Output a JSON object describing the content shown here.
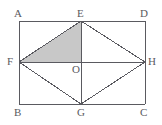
{
  "figure": {
    "kind": "geometry-diagram",
    "background_color": "#ffffff",
    "stroke_color": "#5a5a60",
    "shaded_fill_color": "#c8c8c8",
    "shaded_region_vertices": "E, F, O",
    "rectangle": {
      "name": "ABCD",
      "left": 19,
      "top": 21,
      "right": 145,
      "bottom": 104
    },
    "points": [
      {
        "label": "A",
        "x": 19,
        "y": 21,
        "label_x": 14,
        "label_y": 8,
        "role": "rectangle-corner-top-left"
      },
      {
        "label": "D",
        "x": 145,
        "y": 21,
        "label_x": 140,
        "label_y": 8,
        "role": "rectangle-corner-top-right"
      },
      {
        "label": "B",
        "x": 19,
        "y": 104,
        "label_x": 14,
        "label_y": 107,
        "role": "rectangle-corner-bottom-left"
      },
      {
        "label": "C",
        "x": 145,
        "y": 104,
        "label_x": 140,
        "label_y": 107,
        "role": "rectangle-corner-bottom-right"
      },
      {
        "label": "E",
        "x": 81,
        "y": 21,
        "label_x": 77,
        "label_y": 8,
        "role": "rhombus-vertex-top"
      },
      {
        "label": "G",
        "x": 81,
        "y": 104,
        "label_x": 77,
        "label_y": 107,
        "role": "rhombus-vertex-bottom"
      },
      {
        "label": "F",
        "x": 19,
        "y": 62,
        "label_x": 7,
        "label_y": 56,
        "role": "rhombus-vertex-left"
      },
      {
        "label": "H",
        "x": 145,
        "y": 62,
        "label_x": 148,
        "label_y": 56,
        "role": "rhombus-vertex-right"
      },
      {
        "label": "O",
        "x": 81,
        "y": 62,
        "label_x": 72,
        "label_y": 64,
        "role": "center-intersection"
      }
    ],
    "segments": [
      {
        "name": "rectangle-side-AD",
        "x1": 19,
        "y1": 21,
        "x2": 145,
        "y2": 21
      },
      {
        "name": "rectangle-side-DC",
        "x1": 145,
        "y1": 21,
        "x2": 145,
        "y2": 104
      },
      {
        "name": "rectangle-side-CB",
        "x1": 145,
        "y1": 104,
        "x2": 19,
        "y2": 104
      },
      {
        "name": "rectangle-side-BA",
        "x1": 19,
        "y1": 104,
        "x2": 19,
        "y2": 21
      },
      {
        "name": "rhombus-side-EF",
        "x1": 81,
        "y1": 21,
        "x2": 19,
        "y2": 62
      },
      {
        "name": "rhombus-side-EH",
        "x1": 81,
        "y1": 21,
        "x2": 145,
        "y2": 62
      },
      {
        "name": "rhombus-side-FG",
        "x1": 19,
        "y1": 62,
        "x2": 81,
        "y2": 104
      },
      {
        "name": "rhombus-side-GH",
        "x1": 81,
        "y1": 104,
        "x2": 145,
        "y2": 62
      },
      {
        "name": "diagonal-FH",
        "x1": 19,
        "y1": 62,
        "x2": 145,
        "y2": 62
      },
      {
        "name": "diagonal-EG",
        "x1": 81,
        "y1": 21,
        "x2": 81,
        "y2": 104
      }
    ]
  }
}
